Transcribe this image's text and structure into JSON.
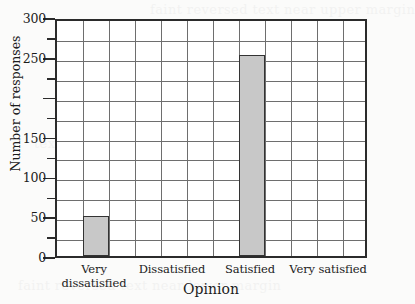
{
  "chart_data": {
    "type": "bar",
    "title": "",
    "xlabel": "Opinion",
    "ylabel": "Number of responses",
    "categories": [
      "Very dissatisfied",
      "Dissatisfied",
      "Satisfied",
      "Very satisfied"
    ],
    "values": [
      50,
      0,
      252,
      0
    ],
    "series": [
      {
        "name": "Number of responses",
        "values": [
          50,
          0,
          252,
          0
        ]
      }
    ],
    "ylim": [
      0,
      300
    ],
    "ytick_step": 25,
    "ytick_label_step": 50,
    "ytick_labels": [
      "0",
      "50",
      "100",
      "150",
      "",
      "250",
      "300"
    ],
    "ytick_label_values": [
      0,
      50,
      100,
      150,
      200,
      250,
      300
    ],
    "grid": true,
    "grid_columns": 12,
    "grid_rows": 12,
    "legend": "none",
    "bar_color": "#c8c8c8",
    "bar_edge_color": "#333333",
    "grid_color": "#6e6e6e",
    "axis_color": "#2b2b2b",
    "background_color": "#fbfbfa",
    "plot_background_color": "#ffffff",
    "bar_grid_columns": [
      2,
      8
    ]
  },
  "artifacts": {
    "bleed_a": "text showing through from reverse of page",
    "bleed_b": "faint reversed text near lower margin",
    "bleed_c": "faint reversed text near upper margin"
  }
}
